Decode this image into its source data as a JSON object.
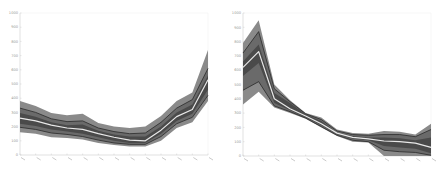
{
  "chart_data": [
    {
      "type": "area",
      "subtype": "fan-chart",
      "title": "",
      "xlabel": "",
      "ylabel": "",
      "ylim": [
        0,
        1000
      ],
      "yticks": [
        0,
        100,
        200,
        300,
        400,
        500,
        600,
        700,
        800,
        900,
        1000
      ],
      "xtick_count": 13,
      "x": [
        1,
        2,
        3,
        4,
        5,
        6,
        7,
        8,
        9,
        10,
        11,
        12,
        13
      ],
      "grid": false,
      "legend": null,
      "series": [
        {
          "name": "upper_outer",
          "values": [
            380,
            345,
            295,
            280,
            290,
            225,
            200,
            190,
            200,
            275,
            380,
            440,
            740
          ]
        },
        {
          "name": "upper_mid",
          "values": [
            330,
            300,
            255,
            235,
            240,
            190,
            165,
            150,
            155,
            230,
            330,
            390,
            610
          ]
        },
        {
          "name": "upper_inner",
          "values": [
            295,
            270,
            230,
            210,
            215,
            170,
            145,
            130,
            130,
            200,
            300,
            355,
            560
          ]
        },
        {
          "name": "median",
          "values": [
            260,
            240,
            210,
            190,
            180,
            150,
            125,
            105,
            100,
            175,
            270,
            320,
            530
          ]
        },
        {
          "name": "lower_inner",
          "values": [
            220,
            205,
            180,
            165,
            150,
            125,
            100,
            85,
            85,
            150,
            240,
            290,
            460
          ]
        },
        {
          "name": "lower_mid",
          "values": [
            195,
            180,
            155,
            145,
            130,
            105,
            85,
            75,
            75,
            130,
            220,
            265,
            420
          ]
        },
        {
          "name": "lower_outer",
          "values": [
            160,
            150,
            125,
            120,
            110,
            85,
            70,
            60,
            60,
            100,
            190,
            230,
            380
          ]
        }
      ]
    },
    {
      "type": "area",
      "subtype": "fan-chart",
      "title": "",
      "xlabel": "",
      "ylabel": "",
      "ylim": [
        0,
        1000
      ],
      "yticks": [
        0,
        100,
        200,
        300,
        400,
        500,
        600,
        700,
        800,
        900,
        1000
      ],
      "xtick_count": 13,
      "x": [
        1,
        2,
        3,
        4,
        5,
        6,
        7,
        8,
        9,
        10,
        11,
        12,
        13
      ],
      "grid": false,
      "legend": null,
      "series": [
        {
          "name": "upper_outer",
          "values": [
            790,
            950,
            500,
            390,
            300,
            270,
            185,
            160,
            155,
            175,
            170,
            150,
            225
          ]
        },
        {
          "name": "upper_mid",
          "values": [
            720,
            870,
            470,
            380,
            295,
            255,
            175,
            150,
            145,
            150,
            150,
            135,
            185
          ]
        },
        {
          "name": "upper_inner",
          "values": [
            660,
            780,
            440,
            370,
            290,
            245,
            165,
            140,
            130,
            130,
            125,
            110,
            130
          ]
        },
        {
          "name": "median",
          "values": [
            620,
            730,
            400,
            330,
            280,
            225,
            160,
            130,
            120,
            105,
            100,
            90,
            60
          ]
        },
        {
          "name": "lower_inner",
          "values": [
            560,
            650,
            370,
            320,
            270,
            215,
            150,
            120,
            110,
            70,
            60,
            50,
            20
          ]
        },
        {
          "name": "lower_mid",
          "values": [
            460,
            520,
            350,
            310,
            265,
            205,
            145,
            110,
            100,
            40,
            30,
            25,
            5
          ]
        },
        {
          "name": "lower_outer",
          "values": [
            360,
            450,
            340,
            300,
            260,
            200,
            140,
            100,
            95,
            0,
            0,
            0,
            0
          ]
        }
      ]
    }
  ],
  "colors": {
    "outer_band": "#8a8a8a",
    "mid_band": "#6a6a6a",
    "inner_band": "#4a4a4a",
    "percentile_line": "#2a2a2a",
    "median_line": "#e8e8e8",
    "axis": "#cfcfcf",
    "tick_text": "#9a9a9a"
  },
  "panels": [
    {
      "name": "left-fan-chart",
      "x0": 20,
      "x1": 208,
      "y0": 155,
      "y1": 13
    },
    {
      "name": "right-fan-chart",
      "x0": 243,
      "x1": 431,
      "y0": 156,
      "y1": 13
    }
  ],
  "ytick_labels": [
    "0",
    "100",
    "200",
    "300",
    "400",
    "500",
    "600",
    "700",
    "800",
    "900",
    "1000"
  ]
}
